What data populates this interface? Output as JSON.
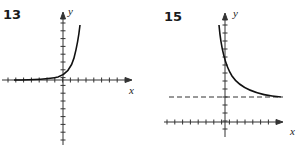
{
  "chart_data": [
    {
      "type": "line",
      "title": "13",
      "xlabel": "x",
      "ylabel": "y",
      "description": "Exponential growth curve, approaching x-axis as x decreases",
      "series": [
        {
          "name": "curve",
          "x": [
            -6,
            -4,
            -2,
            -1,
            0,
            1,
            2
          ],
          "y": [
            0.02,
            0.1,
            0.5,
            1,
            1.5,
            3.5,
            7
          ]
        }
      ],
      "grid": false
    },
    {
      "type": "line",
      "title": "15",
      "xlabel": "x",
      "ylabel": "y",
      "description": "Exponential decay curve with horizontal dashed asymptote",
      "series": [
        {
          "name": "curve",
          "x": [
            -1,
            0,
            1,
            2,
            4,
            7
          ],
          "y": [
            12,
            8,
            5.5,
            4,
            3,
            2.1
          ]
        }
      ],
      "asymptote": {
        "y": 2,
        "style": "dashed"
      },
      "grid": false
    }
  ],
  "labels": {
    "g1_num": "13",
    "g2_num": "15",
    "x": "x",
    "y": "y"
  }
}
